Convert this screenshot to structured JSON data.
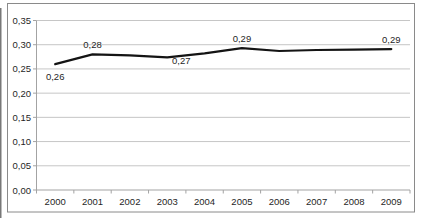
{
  "figure": {
    "title": ""
  },
  "chart_data": {
    "type": "line",
    "title": "",
    "xlabel": "",
    "ylabel": "",
    "categories": [
      "2000",
      "2001",
      "2002",
      "2003",
      "2004",
      "2005",
      "2006",
      "2007",
      "2008",
      "2009"
    ],
    "values": [
      0.26,
      0.28,
      0.278,
      0.274,
      0.282,
      0.293,
      0.287,
      0.289,
      0.29,
      0.291
    ],
    "point_labels": [
      {
        "index": 0,
        "text": "0,26",
        "position": "below"
      },
      {
        "index": 1,
        "text": "0,28",
        "position": "above"
      },
      {
        "index": 3,
        "text": "0,27",
        "position": "below-tight"
      },
      {
        "index": 5,
        "text": "0,29",
        "position": "above"
      },
      {
        "index": 9,
        "text": "0,29",
        "position": "above"
      }
    ],
    "ylim": [
      0,
      0.35
    ],
    "ytick_step": 0.05,
    "ytick_labels": [
      "0,00",
      "0,05",
      "0,10",
      "0,15",
      "0,20",
      "0,25",
      "0,30",
      "0,35"
    ],
    "decimal_separator": ",",
    "grid": true,
    "legend": "none"
  },
  "colors": {
    "background": "#ffffff",
    "chart_border": "#8a8a8a",
    "gridline": "#c6c6c6",
    "axis": "#a3a3a3",
    "series_line": "#141414",
    "text": "#1f1f1f",
    "page_edge": "#787878"
  }
}
